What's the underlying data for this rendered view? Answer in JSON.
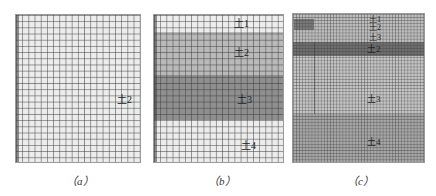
{
  "figure": {
    "panels": [
      {
        "id": "a",
        "caption": "（a）",
        "bands": [
          {
            "top": 0,
            "height": 148,
            "color": "#ececec"
          }
        ],
        "labels": [
          {
            "text": "土2",
            "x": 101,
            "y": 80
          }
        ]
      },
      {
        "id": "b",
        "caption": "（b）",
        "bands": [
          {
            "top": 0,
            "height": 17,
            "color": "#ededed"
          },
          {
            "top": 17,
            "height": 43,
            "color": "#b9b9b9"
          },
          {
            "top": 60,
            "height": 45,
            "color": "#8f8f8f"
          },
          {
            "top": 105,
            "height": 43,
            "color": "#ececec"
          }
        ],
        "labels": [
          {
            "text": "土1",
            "x": 80,
            "y": 4
          },
          {
            "text": "土2",
            "x": 80,
            "y": 33
          },
          {
            "text": "土3",
            "x": 83,
            "y": 80
          },
          {
            "text": "土4",
            "x": 87,
            "y": 126
          }
        ]
      },
      {
        "id": "c",
        "caption": "（c）",
        "bands": [
          {
            "top": 0,
            "height": 28,
            "color": "#bdbdbd"
          },
          {
            "top": 28,
            "height": 14,
            "color": "#6e6e6e"
          },
          {
            "top": 42,
            "height": 58,
            "color": "#c4c4c4"
          },
          {
            "top": 100,
            "height": 49,
            "color": "#a6a6a6"
          }
        ],
        "blocks": [
          {
            "left": 1,
            "top": 5,
            "width": 20,
            "height": 11,
            "color": "#7a7a7a"
          }
        ],
        "labels": [
          {
            "text": "土1",
            "x": 76,
            "y": 1
          },
          {
            "text": "土2",
            "x": 76,
            "y": 9
          },
          {
            "text": "土3",
            "x": 76,
            "y": 19
          },
          {
            "text": "土2",
            "x": 74,
            "y": 30
          },
          {
            "text": "土3",
            "x": 74,
            "y": 80
          },
          {
            "text": "土4",
            "x": 74,
            "y": 123
          }
        ]
      }
    ]
  }
}
